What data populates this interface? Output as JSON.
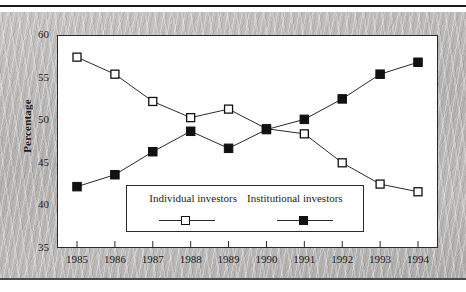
{
  "chart_data": {
    "type": "line",
    "title": "",
    "subtitle": "",
    "xlabel": "",
    "ylabel": "Percentage",
    "categories": [
      "1985",
      "1986",
      "1987",
      "1988",
      "1989",
      "1990",
      "1991",
      "1992",
      "1993",
      "1994"
    ],
    "x": [
      1985,
      1986,
      1987,
      1988,
      1989,
      1990,
      1991,
      1992,
      1993,
      1994
    ],
    "xlim": [
      1985,
      1994
    ],
    "ylim": [
      35,
      60
    ],
    "yticks": [
      35,
      40,
      45,
      50,
      55,
      60
    ],
    "ytick_labels": [
      "35",
      "40",
      "45",
      "50",
      "55",
      "60"
    ],
    "grid": false,
    "legend_position": "inside-bottom-center",
    "series": [
      {
        "name": "Individual investors",
        "marker": "open-square",
        "color": "#111111",
        "values": [
          57.4,
          55.4,
          52.2,
          50.3,
          51.3,
          49.0,
          48.4,
          45.0,
          42.5,
          41.6
        ]
      },
      {
        "name": "Institutional investors",
        "marker": "filled-square",
        "color": "#111111",
        "values": [
          42.2,
          43.6,
          46.3,
          48.7,
          46.7,
          48.9,
          50.1,
          52.5,
          55.4,
          56.8
        ]
      }
    ]
  },
  "legend": {
    "individual_label": "Individual investors",
    "institutional_label": "Institutional investors"
  },
  "axes": {
    "y_title": "Percentage"
  }
}
